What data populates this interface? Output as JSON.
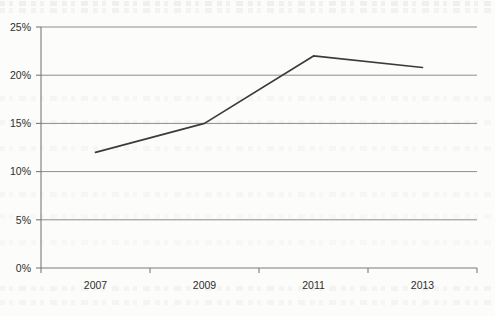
{
  "chart_data": {
    "type": "line",
    "title": "",
    "subtitle": "",
    "xlabel": "",
    "ylabel": "",
    "x": [
      2007,
      2009,
      2011,
      2013
    ],
    "categories": [
      "2007",
      "2009",
      "2011",
      "2013"
    ],
    "series": [
      {
        "name": "",
        "values": [
          12,
          15,
          22,
          20.8
        ]
      }
    ],
    "values": [
      12,
      15,
      22,
      20.8
    ],
    "ylim": [
      0,
      25
    ],
    "xlim": [
      2006,
      2014
    ],
    "y_tick_values": [
      0,
      5,
      10,
      15,
      20,
      25
    ],
    "y_tick_labels": [
      "0%",
      "5%",
      "10%",
      "15%",
      "20%",
      "25%"
    ],
    "x_tick_labels": [
      "2007",
      "2009",
      "2011",
      "2013"
    ],
    "grid": true,
    "grid_axis": "y",
    "legend": false,
    "legend_position": "none",
    "annotations": [],
    "value_format": "percent",
    "colors": {
      "line": "#3b3b3b",
      "grid": "#8d8d8d",
      "axis": "#7a7a7a",
      "tick_label": "#2c2c2c",
      "background": "#fcfcfb"
    }
  },
  "axes": {
    "y_ticks": [
      {
        "label": "25%",
        "value": 25
      },
      {
        "label": "20%",
        "value": 20
      },
      {
        "label": "15%",
        "value": 15
      },
      {
        "label": "10%",
        "value": 10
      },
      {
        "label": "5%",
        "value": 5
      },
      {
        "label": "0%",
        "value": 0
      }
    ],
    "x_ticks": [
      {
        "label": "2007",
        "value": 2007
      },
      {
        "label": "2009",
        "value": 2009
      },
      {
        "label": "2011",
        "value": 2011
      },
      {
        "label": "2013",
        "value": 2013
      }
    ]
  }
}
